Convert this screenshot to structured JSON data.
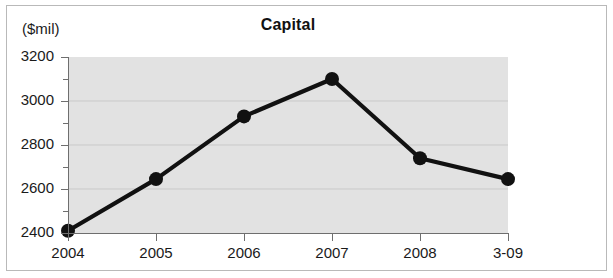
{
  "figure": {
    "title": "Capital",
    "y_unit_label": "($mil)"
  },
  "chart_data": {
    "type": "line",
    "title": "Capital",
    "xlabel": "",
    "ylabel": "($mil)",
    "categories": [
      "2004",
      "2005",
      "2006",
      "2007",
      "2008",
      "3-09"
    ],
    "values": [
      2410,
      2645,
      2930,
      3100,
      2740,
      2645
    ],
    "series": [
      {
        "name": "Capital",
        "values": [
          2410,
          2645,
          2930,
          3100,
          2740,
          2645
        ]
      }
    ],
    "ylim": [
      2400,
      3200
    ],
    "y_major_ticks": [
      2400,
      2600,
      2800,
      3000,
      3200
    ],
    "y_minor_ticks": [
      2500,
      2700,
      2900,
      3100
    ],
    "y_tick_labels": [
      "2400",
      "2600",
      "2800",
      "3000",
      "3200"
    ],
    "x_tick_labels": [
      "2004",
      "2005",
      "2006",
      "2007",
      "2008",
      "3-09"
    ],
    "grid": true,
    "grid_axis": "y",
    "legend": false,
    "legend_position": "none",
    "marker": "circle",
    "line_color": "#111111",
    "marker_color": "#111111",
    "plot_background": "#e2e2e2",
    "grid_color": "#c9c9c9",
    "axis_color": "#6e6e6e",
    "frame_color": "#b9b9b9"
  }
}
